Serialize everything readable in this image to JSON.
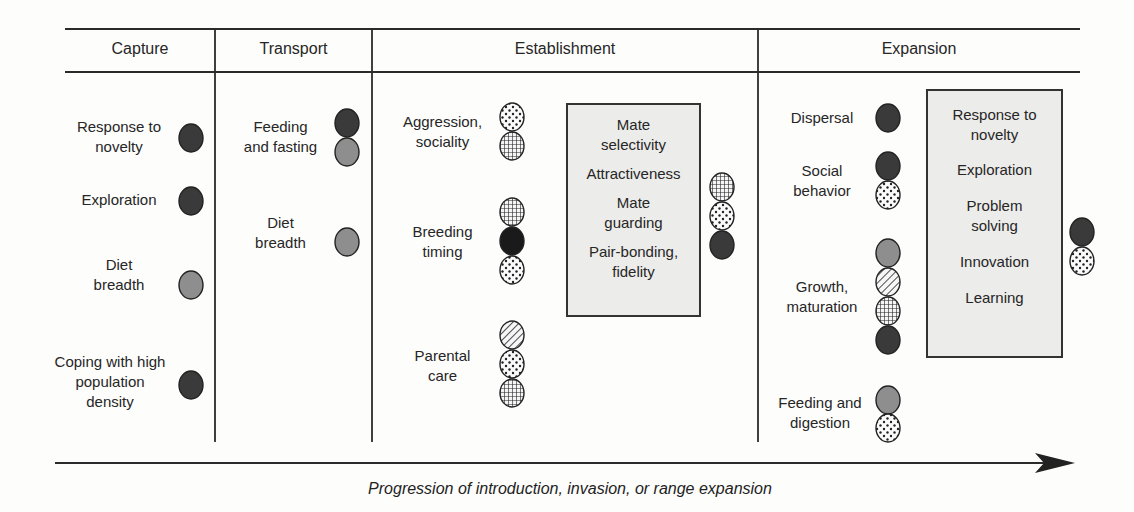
{
  "figure": {
    "caption": "Progression of introduction, invasion, or range expansion",
    "columns": [
      {
        "title": "Capture",
        "items": [
          {
            "label": "Response to\nnovelty",
            "dots": [
              "dark"
            ]
          },
          {
            "label": "Exploration",
            "dots": [
              "dark"
            ]
          },
          {
            "label": "Diet\nbreadth",
            "dots": [
              "gray"
            ]
          },
          {
            "label": "Coping with high\npopulation\ndensity",
            "dots": [
              "dark"
            ]
          }
        ]
      },
      {
        "title": "Transport",
        "items": [
          {
            "label": "Feeding\nand fasting",
            "dots": [
              "dark",
              "gray"
            ]
          },
          {
            "label": "Diet\nbreadth",
            "dots": [
              "gray"
            ]
          }
        ]
      },
      {
        "title": "Establishment",
        "items": [
          {
            "label": "Aggression,\nsociality",
            "dots": [
              "dotted",
              "crosshatch"
            ]
          },
          {
            "label": "Breeding\ntiming",
            "dots": [
              "crosshatch",
              "black",
              "dotted"
            ]
          },
          {
            "label": "Parental\ncare",
            "dots": [
              "hatched",
              "dotted",
              "crosshatch"
            ]
          }
        ],
        "box": {
          "items": [
            "Mate\nselectivity",
            "Attractiveness",
            "Mate\nguarding",
            "Pair-bonding,\nfidelity"
          ],
          "dots": [
            "crosshatch",
            "dotted",
            "dark"
          ]
        }
      },
      {
        "title": "Expansion",
        "items": [
          {
            "label": "Dispersal",
            "dots": [
              "dark"
            ]
          },
          {
            "label": "Social\nbehavior",
            "dots": [
              "dark",
              "dotted"
            ]
          },
          {
            "label": "Growth,\nmaturation",
            "dots": [
              "gray",
              "hatched",
              "crosshatch",
              "dark"
            ]
          },
          {
            "label": "Feeding and\ndigestion",
            "dots": [
              "gray",
              "dotted"
            ]
          }
        ],
        "box": {
          "items": [
            "Response to\nnovelty",
            "Exploration",
            "Problem\nsolving",
            "Innovation",
            "Learning"
          ],
          "dots": [
            "dark",
            "dotted"
          ]
        }
      }
    ],
    "dot_legend": {
      "dark": "#3a3a3a",
      "black": "#1a1a1a",
      "gray": "#8e8e8e",
      "dotted": "dotted pattern",
      "crosshatch": "grid pattern",
      "hatched": "diagonal-line pattern"
    }
  }
}
